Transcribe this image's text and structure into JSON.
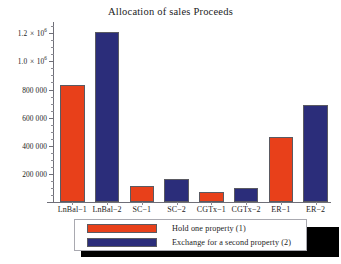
{
  "chart_data": {
    "type": "bar",
    "title": "Allocation of sales Proceeds",
    "xlabel": "",
    "ylabel": "",
    "categories": [
      "LnBal−1",
      "LnBal−2",
      "SC−1",
      "SC−2",
      "CGTx−1",
      "CGTx−2",
      "ER−1",
      "ER−2"
    ],
    "values": [
      830000,
      1210000,
      115000,
      165000,
      70000,
      100000,
      465000,
      690000
    ],
    "bar_series": [
      {
        "category": "LnBal−1",
        "value": 830000,
        "series": "Hold one property (1)",
        "color": "#e8401a"
      },
      {
        "category": "LnBal−2",
        "value": 1210000,
        "series": "Exchange for a second property (2)",
        "color": "#2b2d7a"
      },
      {
        "category": "SC−1",
        "value": 115000,
        "series": "Hold one property (1)",
        "color": "#e8401a"
      },
      {
        "category": "SC−2",
        "value": 165000,
        "series": "Exchange for a second property (2)",
        "color": "#2b2d7a"
      },
      {
        "category": "CGTx−1",
        "value": 70000,
        "series": "Hold one property (1)",
        "color": "#e8401a"
      },
      {
        "category": "CGTx−2",
        "value": 100000,
        "series": "Exchange for a second property (2)",
        "color": "#2b2d7a"
      },
      {
        "category": "ER−1",
        "value": 465000,
        "series": "Hold one property (1)",
        "color": "#e8401a"
      },
      {
        "category": "ER−2",
        "value": 690000,
        "series": "Exchange for a second property (2)",
        "color": "#2b2d7a"
      }
    ],
    "ylim": [
      0,
      1280000
    ],
    "yticks": [
      200000,
      400000,
      600000,
      800000,
      1000000,
      1200000
    ],
    "ytick_labels": [
      "200 000",
      "400 000",
      "600 000",
      "800 000",
      "1.0 × 10",
      "1.2 × 10"
    ],
    "ytick_exponents": [
      "",
      "",
      "",
      "",
      "6",
      "6"
    ],
    "grid": false,
    "legend_position": "bottom",
    "legend": [
      {
        "label": "Hold one property (1)",
        "color": "#e8401a"
      },
      {
        "label": "Exchange for a second property (2)",
        "color": "#2b2d7a"
      }
    ]
  },
  "colors": {
    "series1": "#e8401a",
    "series2": "#2b2d7a",
    "axis": "#6f6f78",
    "text": "#1c1c1c",
    "background": "#ffffff",
    "legend_shadow": "#000000",
    "legend_border": "#a9a9b0"
  }
}
